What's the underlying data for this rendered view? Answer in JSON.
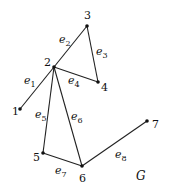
{
  "graph": {
    "name": "G",
    "vertices": [
      {
        "id": "1",
        "label": "1",
        "x": 20,
        "y": 109,
        "lx": 12,
        "ly": 115
      },
      {
        "id": "2",
        "label": "2",
        "x": 54,
        "y": 67,
        "lx": 44,
        "ly": 66
      },
      {
        "id": "3",
        "label": "3",
        "x": 87,
        "y": 26,
        "lx": 84,
        "ly": 19
      },
      {
        "id": "4",
        "label": "4",
        "x": 98,
        "y": 82,
        "lx": 101,
        "ly": 91
      },
      {
        "id": "5",
        "label": "5",
        "x": 43,
        "y": 153,
        "lx": 33,
        "ly": 161
      },
      {
        "id": "6",
        "label": "6",
        "x": 82,
        "y": 166,
        "lx": 79,
        "ly": 182
      },
      {
        "id": "7",
        "label": "7",
        "x": 147,
        "y": 121,
        "lx": 152,
        "ly": 128
      }
    ],
    "edges": [
      {
        "id": "e1",
        "label": "e",
        "sub": "1",
        "from": "1",
        "to": "2",
        "lx": 24,
        "ly": 84
      },
      {
        "id": "e2",
        "label": "e",
        "sub": "2",
        "from": "2",
        "to": "3",
        "lx": 59,
        "ly": 43
      },
      {
        "id": "e3",
        "label": "e",
        "sub": "3",
        "from": "3",
        "to": "4",
        "lx": 96,
        "ly": 55
      },
      {
        "id": "e4",
        "label": "e",
        "sub": "4",
        "from": "2",
        "to": "4",
        "lx": 68,
        "ly": 84
      },
      {
        "id": "e5",
        "label": "e",
        "sub": "5",
        "from": "2",
        "to": "5",
        "lx": 35,
        "ly": 118
      },
      {
        "id": "e6",
        "label": "e",
        "sub": "6",
        "from": "2",
        "to": "6",
        "lx": 71,
        "ly": 120
      },
      {
        "id": "e7",
        "label": "e",
        "sub": "7",
        "from": "5",
        "to": "6",
        "lx": 55,
        "ly": 174
      },
      {
        "id": "e8",
        "label": "e",
        "sub": "8",
        "from": "6",
        "to": "7",
        "lx": 115,
        "ly": 158
      }
    ],
    "graph_label": {
      "text": "G",
      "x": 136,
      "y": 180
    }
  }
}
